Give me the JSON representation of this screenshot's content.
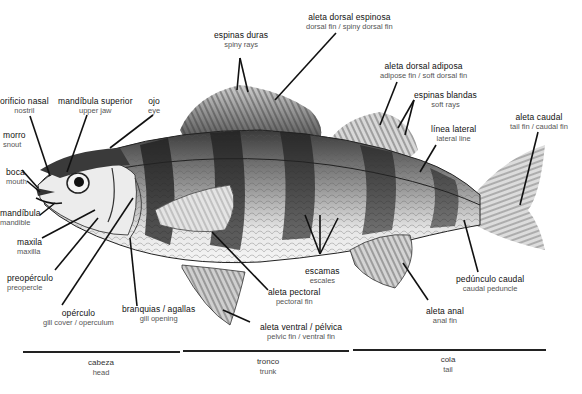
{
  "diagram": {
    "labels": {
      "orificio_nasal": {
        "es": "orificio nasal",
        "en": "nostril"
      },
      "mandibula_superior": {
        "es": "mandíbula superior",
        "en": "upper jaw"
      },
      "ojo": {
        "es": "ojo",
        "en": "eye"
      },
      "morro": {
        "es": "morro",
        "en": "snout"
      },
      "boca": {
        "es": "boca",
        "en": "mouth"
      },
      "mandibula": {
        "es": "mandíbula",
        "en": "mandible"
      },
      "maxila": {
        "es": "maxila",
        "en": "maxilla"
      },
      "preoperculo": {
        "es": "preopérculo",
        "en": "preopercle"
      },
      "operculo": {
        "es": "opérculo",
        "en": "gill cover / operculum"
      },
      "branquias": {
        "es": "branquias / agallas",
        "en": "gill opening"
      },
      "espinas_duras": {
        "es": "espinas duras",
        "en": "spiny rays"
      },
      "aleta_dorsal_espinosa": {
        "es": "aleta dorsal espinosa",
        "en": "dorsal fin / spiny dorsal fin"
      },
      "aleta_dorsal_adiposa": {
        "es": "aleta dorsal adiposa",
        "en": "adipose fin /  soft dorsal fin"
      },
      "espinas_blandas": {
        "es": "espinas blandas",
        "en": "soft rays"
      },
      "linea_lateral": {
        "es": "línea lateral",
        "en": "lateral line"
      },
      "aleta_caudal": {
        "es": "aleta caudal",
        "en": "tail fin / caudal fin"
      },
      "escamas": {
        "es": "escamas",
        "en": "escales"
      },
      "aleta_pectoral": {
        "es": "aleta pectoral",
        "en": "pectoral fin"
      },
      "aleta_ventral": {
        "es": "aleta ventral / pélvica",
        "en": "pelvic fin / ventral fin"
      },
      "aleta_anal": {
        "es": "aleta anal",
        "en": "anal fin"
      },
      "pedunculo_caudal": {
        "es": "pedúnculo caudal",
        "en": "caudal peduncle"
      }
    },
    "regions": [
      {
        "es": "cabeza",
        "en": "head"
      },
      {
        "es": "tronco",
        "en": "trunk"
      },
      {
        "es": "cola",
        "en": "tail"
      }
    ],
    "colors": {
      "ink": "#111111",
      "body_light": "#e8e8e8",
      "band_dark": "#2a2a2a",
      "background": "#ffffff"
    }
  }
}
